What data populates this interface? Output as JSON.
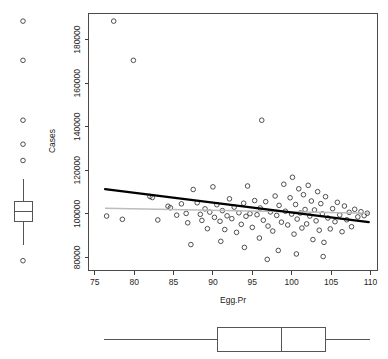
{
  "chart_data": {
    "type": "scatter",
    "title": "",
    "xlabel": "Egg.Pr",
    "ylabel": "Cases",
    "xlim": [
      74.2,
      110.9
    ],
    "ylim": [
      74000,
      192000
    ],
    "grid": false,
    "legend": null,
    "x_ticks": [
      75,
      80,
      85,
      90,
      95,
      100,
      105,
      110
    ],
    "x_tick_labels": [
      "75",
      "80",
      "85",
      "90",
      "95",
      "100",
      "105",
      "110"
    ],
    "y_ticks": [
      80000,
      100000,
      120000,
      140000,
      160000,
      180000
    ],
    "y_tick_labels": [
      "80000",
      "100000",
      "120000",
      "140000",
      "160000",
      "180000"
    ],
    "marker": "open-circle",
    "points": [
      [
        77.4,
        188500
      ],
      [
        79.9,
        170500
      ],
      [
        96.2,
        143000
      ],
      [
        76.5,
        99000
      ],
      [
        78.5,
        97500
      ],
      [
        82.0,
        108000
      ],
      [
        82.3,
        107500
      ],
      [
        83.0,
        97200
      ],
      [
        84.3,
        103500
      ],
      [
        84.6,
        102800
      ],
      [
        85.4,
        99400
      ],
      [
        86.0,
        104600
      ],
      [
        86.6,
        100200
      ],
      [
        86.8,
        95900
      ],
      [
        87.5,
        111200
      ],
      [
        88.0,
        105100
      ],
      [
        88.4,
        99800
      ],
      [
        88.6,
        97000
      ],
      [
        89.0,
        102300
      ],
      [
        89.3,
        93200
      ],
      [
        89.6,
        100800
      ],
      [
        90.0,
        112400
      ],
      [
        90.2,
        98400
      ],
      [
        90.5,
        104200
      ],
      [
        90.9,
        96600
      ],
      [
        91.2,
        101500
      ],
      [
        91.5,
        92800
      ],
      [
        91.8,
        99100
      ],
      [
        92.1,
        106900
      ],
      [
        92.4,
        97800
      ],
      [
        92.7,
        103100
      ],
      [
        93.0,
        91500
      ],
      [
        93.3,
        100500
      ],
      [
        93.6,
        95200
      ],
      [
        93.9,
        104900
      ],
      [
        94.2,
        98900
      ],
      [
        94.4,
        112800
      ],
      [
        94.7,
        100100
      ],
      [
        95.0,
        93800
      ],
      [
        95.3,
        106100
      ],
      [
        95.6,
        99600
      ],
      [
        95.9,
        88900
      ],
      [
        96.0,
        102700
      ],
      [
        96.4,
        97100
      ],
      [
        96.7,
        105600
      ],
      [
        97.0,
        94400
      ],
      [
        97.3,
        100900
      ],
      [
        97.6,
        92100
      ],
      [
        97.9,
        108200
      ],
      [
        98.1,
        99300
      ],
      [
        98.4,
        103900
      ],
      [
        98.7,
        96200
      ],
      [
        99.0,
        113600
      ],
      [
        99.2,
        101200
      ],
      [
        99.5,
        94900
      ],
      [
        99.8,
        107400
      ],
      [
        100.0,
        99900
      ],
      [
        100.1,
        116800
      ],
      [
        100.3,
        90700
      ],
      [
        100.5,
        104300
      ],
      [
        100.7,
        97600
      ],
      [
        100.9,
        111500
      ],
      [
        101.1,
        100400
      ],
      [
        101.3,
        93500
      ],
      [
        101.5,
        108800
      ],
      [
        101.7,
        102000
      ],
      [
        101.9,
        95400
      ],
      [
        102.1,
        113100
      ],
      [
        102.3,
        99000
      ],
      [
        102.5,
        105900
      ],
      [
        102.7,
        88200
      ],
      [
        102.9,
        101800
      ],
      [
        103.1,
        96800
      ],
      [
        103.3,
        110200
      ],
      [
        103.5,
        92500
      ],
      [
        103.7,
        104700
      ],
      [
        103.9,
        100000
      ],
      [
        104.1,
        86900
      ],
      [
        104.3,
        107900
      ],
      [
        104.6,
        98100
      ],
      [
        104.9,
        93100
      ],
      [
        105.2,
        102400
      ],
      [
        105.5,
        96400
      ],
      [
        105.8,
        105300
      ],
      [
        106.1,
        99500
      ],
      [
        106.4,
        91800
      ],
      [
        106.7,
        103600
      ],
      [
        107.0,
        97300
      ],
      [
        107.3,
        100700
      ],
      [
        107.6,
        94100
      ],
      [
        108.0,
        102100
      ],
      [
        108.4,
        98600
      ],
      [
        108.8,
        101000
      ],
      [
        109.2,
        99200
      ],
      [
        109.6,
        100300
      ],
      [
        87.2,
        85900
      ],
      [
        91.0,
        87400
      ],
      [
        94.0,
        84600
      ],
      [
        98.3,
        83200
      ],
      [
        100.6,
        81600
      ],
      [
        104.0,
        80400
      ],
      [
        96.9,
        79100
      ]
    ],
    "fit_line": {
      "name": "regression-line",
      "color": "#000000",
      "x1": 76.3,
      "y1": 111400,
      "x2": 109.8,
      "y2": 96200
    },
    "reference_line": {
      "name": "mean-line",
      "color": "#bcbcbc",
      "x1": 76.3,
      "y1": 102600,
      "x2": 109.8,
      "y2": 100300
    }
  },
  "marginal_boxplots": {
    "y_boxplot": {
      "orientation": "vertical",
      "variable": "Cases",
      "whisker_low": 85500,
      "q1": 96300,
      "median": 101200,
      "q3": 105900,
      "whisker_high": 116000,
      "outliers": [
        188500,
        170500,
        143000,
        132000,
        124500,
        78500
      ]
    },
    "x_boxplot": {
      "orientation": "horizontal",
      "variable": "Egg.Pr",
      "whisker_low": 76.2,
      "q1": 90.6,
      "median": 98.7,
      "q3": 104.3,
      "whisker_high": 109.9,
      "outliers": []
    }
  },
  "axes": {
    "x_title": "Egg.Pr",
    "y_title": "Cases"
  }
}
